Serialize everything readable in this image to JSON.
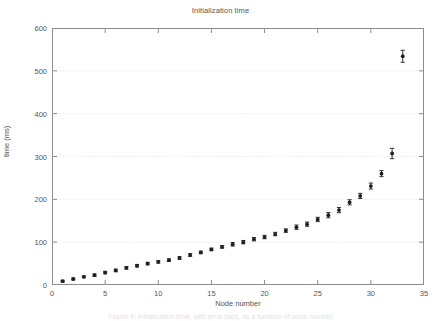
{
  "figure": {
    "caption": "Figure 4: Initialization time, with error bars, as a function of node number"
  },
  "axis_titles": {
    "x": "Node number",
    "y": "time (ms)"
  },
  "chart_data": {
    "type": "scatter",
    "title": "Initialization time",
    "xlabel": "Node number",
    "ylabel": "time (ms)",
    "xlim": [
      0,
      35
    ],
    "ylim": [
      0,
      600
    ],
    "xticks": [
      0,
      5,
      10,
      15,
      20,
      25,
      30,
      35
    ],
    "yticks": [
      0,
      100,
      200,
      300,
      400,
      500,
      600
    ],
    "grid": true,
    "grid_axis": "y",
    "legend": "none",
    "marker": "filled-circle-with-errorbar",
    "series": [
      {
        "name": "Initialization time",
        "x": [
          1,
          2,
          3,
          4,
          5,
          6,
          7,
          8,
          9,
          10,
          11,
          12,
          13,
          14,
          15,
          16,
          17,
          18,
          19,
          20,
          21,
          22,
          23,
          24,
          25,
          26,
          27,
          28,
          29,
          30,
          31,
          32,
          33
        ],
        "y": [
          9,
          14,
          19,
          23,
          29,
          34,
          40,
          45,
          50,
          54,
          58,
          63,
          70,
          76,
          83,
          89,
          95,
          100,
          107,
          112,
          119,
          127,
          135,
          142,
          153,
          163,
          175,
          193,
          208,
          231,
          260,
          307,
          534
        ],
        "yerr": [
          2,
          2,
          2,
          3,
          3,
          3,
          3,
          3,
          3,
          3,
          3,
          3,
          3,
          3,
          3,
          3,
          4,
          4,
          4,
          4,
          4,
          4,
          5,
          5,
          5,
          6,
          6,
          6,
          6,
          7,
          7,
          12,
          14
        ]
      }
    ]
  },
  "colors": {
    "marker": "#1f1f1f",
    "frame": "#8d8d8d",
    "grid": "#dcdcdc",
    "text": "#555555",
    "background": "#ffffff"
  }
}
